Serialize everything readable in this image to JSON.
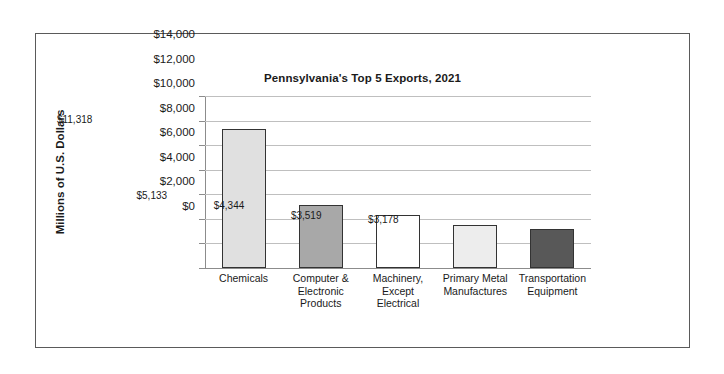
{
  "chart_data": {
    "type": "bar",
    "title": "Pennsylvania's Top 5 Exports, 2021",
    "xlabel": "",
    "ylabel": "Millions of U.S. Dollars",
    "ylim": [
      0,
      14000
    ],
    "ytick_step": 2000,
    "grid": true,
    "legend": "none",
    "categories": [
      "Chemicals",
      "Computer & Electronic Products",
      "Machinery, Except Electrical",
      "Primary Metal Manufactures",
      "Transportation Equipment"
    ],
    "category_lines": [
      [
        "Chemicals"
      ],
      [
        "Computer &",
        "Electronic",
        "Products"
      ],
      [
        "Machinery,",
        "Except",
        "Electrical"
      ],
      [
        "Primary Metal",
        "Manufactures"
      ],
      [
        "Transportation",
        "Equipment"
      ]
    ],
    "values": [
      11318,
      5133,
      4344,
      3519,
      3178
    ],
    "value_labels": [
      "$11,318",
      "$5,133",
      "$4,344",
      "$3,519",
      "$3,178"
    ],
    "bar_colors": [
      "#e0e0e0",
      "#a8a8a8",
      "#ffffff",
      "#ededed",
      "#585858"
    ],
    "bar_border_color": "#333333",
    "ytick_labels": [
      "$0",
      "$2,000",
      "$4,000",
      "$6,000",
      "$8,000",
      "$10,000",
      "$12,000",
      "$14,000"
    ],
    "ytick_values": [
      0,
      2000,
      4000,
      6000,
      8000,
      10000,
      12000,
      14000
    ],
    "colors": {
      "gridline": "#bfbfbf",
      "axis": "#8c8c8c",
      "frame": "#5a5a5a",
      "text": "#1a1a1a",
      "background": "#ffffff"
    }
  }
}
